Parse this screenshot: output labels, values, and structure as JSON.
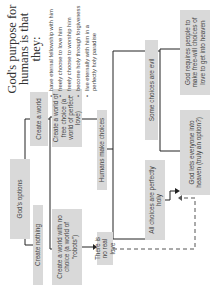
{
  "purpose": {
    "title": "God's purpose for humans is that they:",
    "bullets": [
      "have eternal fellowship with him",
      "freely choose to love him",
      "freely choose to worship him",
      "become holy through forgiveness",
      "live eternally with him in a perfectly holy paradise"
    ]
  },
  "nodes": {
    "gods_options": "God's options",
    "create_nothing": "Create nothing",
    "create_world": "Create a world",
    "no_choice_world": "Create a world with no choice (a world of \"robots\")",
    "free_choice_world": "Create a world of free choice (a world of perfect love)",
    "no_real_love": "There is no real love",
    "humans_make_choices": "Humans make choices",
    "all_holy": "All choices are perfectly holy",
    "some_evil": "Some choices are evil",
    "lets_everyone_in": "God lets everyone into heaven (truly an option?)",
    "requires_love": "God requires people to make free-will choices of love to get into heaven"
  },
  "colors": {
    "box_fill": "#d9d9d9",
    "line": "#222222",
    "text": "#444444"
  }
}
